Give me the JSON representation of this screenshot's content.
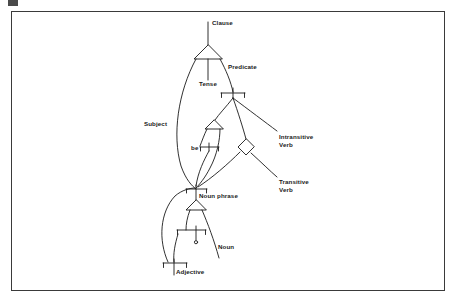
{
  "figure": {
    "type": "grammar-transition-network-diagram",
    "frame": {
      "stroke_color": "#3a3a3a",
      "background": "#ffffff"
    },
    "line_color": "#1a1a1a",
    "text_color": "#1a1a1a"
  },
  "labels": {
    "clause": "Clause",
    "predicate": "Predicate",
    "tense": "Tense",
    "subject": "Subject",
    "be": "be",
    "intransitive_verb_line1": "Intransitive",
    "intransitive_verb_line2": "Verb",
    "transitive_verb_line1": "Transitive",
    "transitive_verb_line2": "Verb",
    "noun_phrase": "Noun phrase",
    "noun": "Noun",
    "adjective": "Adjective"
  },
  "nodes": [
    {
      "id": "clause",
      "name": "Clause",
      "shape": "and-triangle",
      "x": 208,
      "y": 52
    },
    {
      "id": "predicate",
      "name": "Predicate",
      "shape": "or-bracket",
      "x": 233,
      "y": 94
    },
    {
      "id": "tense",
      "name": "Tense",
      "shape": "edge-label",
      "x": 208,
      "y": 75
    },
    {
      "id": "subject",
      "name": "Subject",
      "shape": "edge-label",
      "x": 158,
      "y": 123
    },
    {
      "id": "be-triangle",
      "name": "be",
      "shape": "and-triangle",
      "x": 214,
      "y": 124
    },
    {
      "id": "be-bracket",
      "name": "be",
      "shape": "or-bracket",
      "x": 209,
      "y": 146
    },
    {
      "id": "verb-diamond",
      "name": "verb-diamond",
      "shape": "diamond",
      "x": 247,
      "y": 146
    },
    {
      "id": "intransitive-verb",
      "name": "Intransitive Verb",
      "shape": "edge-label",
      "x": 280,
      "y": 135
    },
    {
      "id": "transitive-verb",
      "name": "Transitive Verb",
      "shape": "edge-label",
      "x": 280,
      "y": 180
    },
    {
      "id": "noun-phrase",
      "name": "Noun phrase",
      "shape": "or-bracket",
      "x": 196,
      "y": 188
    },
    {
      "id": "np-triangle",
      "name": "noun-phrase-and",
      "shape": "and-triangle",
      "x": 196,
      "y": 205
    },
    {
      "id": "noun-bracket",
      "name": "Noun",
      "shape": "or-bracket",
      "x": 196,
      "y": 230
    },
    {
      "id": "empty-circle",
      "name": "empty-production",
      "shape": "circle",
      "x": 196,
      "y": 242
    },
    {
      "id": "adjective-bracket",
      "name": "Adjective",
      "shape": "or-bracket",
      "x": 174,
      "y": 263
    }
  ],
  "edges": [
    {
      "from": "clause",
      "to": "subject-path",
      "label": "Subject"
    },
    {
      "from": "clause",
      "to": "tense-stub",
      "label": "Tense"
    },
    {
      "from": "clause",
      "to": "predicate",
      "label": "Predicate"
    },
    {
      "from": "predicate",
      "to": "be-triangle",
      "label": "be"
    },
    {
      "from": "predicate",
      "to": "verb-diamond",
      "label": ""
    },
    {
      "from": "predicate",
      "to": "intransitive-verb",
      "label": "Intransitive Verb"
    },
    {
      "from": "be-triangle",
      "to": "be-bracket",
      "label": "be"
    },
    {
      "from": "be-triangle",
      "to": "noun-phrase",
      "label": ""
    },
    {
      "from": "verb-diamond",
      "to": "noun-phrase",
      "label": ""
    },
    {
      "from": "verb-diamond",
      "to": "transitive-verb",
      "label": "Transitive Verb"
    },
    {
      "from": "noun-phrase",
      "to": "np-triangle",
      "label": "Noun phrase"
    },
    {
      "from": "np-triangle",
      "to": "noun-bracket",
      "label": "Noun"
    },
    {
      "from": "np-triangle",
      "to": "noun-tail",
      "label": "Noun"
    },
    {
      "from": "noun-bracket",
      "to": "empty-circle",
      "label": ""
    },
    {
      "from": "noun-bracket",
      "to": "adjective-bracket",
      "label": "Adjective"
    },
    {
      "from": "adjective-bracket",
      "to": "noun-phrase",
      "label": ""
    }
  ]
}
